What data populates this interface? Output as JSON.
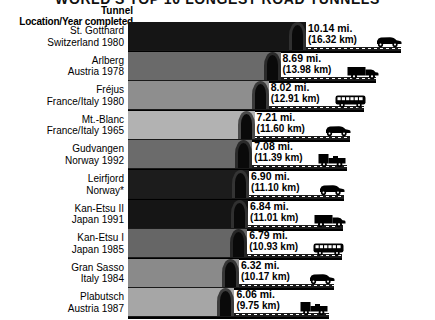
{
  "title": "WORLD'S TOP 10 LONGEST ROAD TUNNELS",
  "header": {
    "line1": "Tunnel",
    "line2": "Location/Year completed"
  },
  "footnote": "*",
  "chart_data": {
    "type": "bar",
    "title": "WORLD'S TOP 10 LONGEST ROAD TUNNELS",
    "xlabel": "",
    "ylabel": "",
    "unit_primary": "mi.",
    "unit_secondary": "km",
    "orientation": "horizontal",
    "grid": false,
    "legend": "none",
    "xlim": [
      0,
      10.14
    ],
    "categories": [
      "St. Gotthard",
      "Arlberg",
      "Fréjus",
      "Mt.-Blanc",
      "Gudvangen",
      "Leirfjord",
      "Kan-Etsu II",
      "Kan-Etsu I",
      "Gran Sasso",
      "Plabutsch"
    ],
    "values": [
      10.14,
      8.69,
      8.02,
      7.21,
      7.08,
      6.9,
      6.84,
      6.79,
      6.32,
      6.06
    ],
    "values_km": [
      16.32,
      13.98,
      12.91,
      11.6,
      11.39,
      11.1,
      11.01,
      10.93,
      10.17,
      9.75
    ]
  },
  "rows": [
    {
      "name": "St. Gotthard",
      "location": "Switzerland  1980",
      "miles": "10.14 mi.",
      "km": "(16.32 km)",
      "mi_value": 10.14,
      "color": "#151515",
      "portal": "#303030",
      "vehicle": "car-icon"
    },
    {
      "name": "Arlberg",
      "location": "Austria  1978",
      "miles": "8.69 mi.",
      "km": "(13.98 km)",
      "mi_value": 8.69,
      "color": "#6a6a6a",
      "portal": "#2a2a2a",
      "vehicle": "truck-icon"
    },
    {
      "name": "Fréjus",
      "location": "France/Italy  1980",
      "miles": "8.02 mi.",
      "km": "(12.91 km)",
      "mi_value": 8.02,
      "color": "#8e8e8e",
      "portal": "#3a3a3a",
      "vehicle": "bus-icon"
    },
    {
      "name": "Mt.-Blanc",
      "location": "France/Italy  1965",
      "miles": "7.21 mi.",
      "km": "(11.60 km)",
      "mi_value": 7.21,
      "color": "#b2b2b2",
      "portal": "#4a4a4a",
      "vehicle": "car-icon"
    },
    {
      "name": "Gudvangen",
      "location": "Norway  1992",
      "miles": "7.08 mi.",
      "km": "(11.39 km)",
      "mi_value": 7.08,
      "color": "#6b6b6b",
      "portal": "#2a2a2a",
      "vehicle": "pickup-icon"
    },
    {
      "name": "Leirfjord",
      "location": "Norway*",
      "miles": "6.90 mi.",
      "km": "(11.10 km)",
      "mi_value": 6.9,
      "color": "#1c1c1c",
      "portal": "#343434",
      "vehicle": "car-icon"
    },
    {
      "name": "Kan-Etsu II",
      "location": "Japan  1991",
      "miles": "6.84 mi.",
      "km": "(11.01 km)",
      "mi_value": 6.84,
      "color": "#151515",
      "portal": "#303030",
      "vehicle": "truck-icon"
    },
    {
      "name": "Kan-Etsu I",
      "location": "Japan  1985",
      "miles": "6.79 mi.",
      "km": "(10.93 km)",
      "mi_value": 6.79,
      "color": "#666666",
      "portal": "#262626",
      "vehicle": "bus-icon"
    },
    {
      "name": "Gran Sasso",
      "location": "Italy  1984",
      "miles": "6.32 mi.",
      "km": "(10.17 km)",
      "mi_value": 6.32,
      "color": "#8a8a8a",
      "portal": "#363636",
      "vehicle": "car-icon"
    },
    {
      "name": "Plabutsch",
      "location": "Austria  1987",
      "miles": "6.06 mi.",
      "km": "(9.75 km)",
      "mi_value": 6.06,
      "color": "#a6a6a6",
      "portal": "#3c3c3c",
      "vehicle": "pickup-icon"
    }
  ]
}
